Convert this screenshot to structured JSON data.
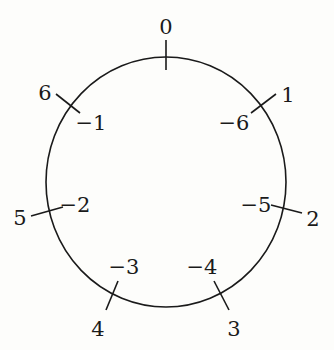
{
  "diagram": {
    "type": "circular number line",
    "circle": {
      "cx": 166,
      "cy": 182,
      "rx": 120,
      "ry": 125,
      "stroke": "#1a1a1a"
    },
    "ticks": [
      {
        "outer": "0",
        "inner": "",
        "x1": 166,
        "y1": 40,
        "x2": 166,
        "y2": 70,
        "ox": 166,
        "oy": 34,
        "ix": 0,
        "iy": 0
      },
      {
        "outer": "1",
        "inner": "-6",
        "x1": 276,
        "y1": 94,
        "x2": 251,
        "y2": 113,
        "ox": 288,
        "oy": 102,
        "ix": 234,
        "iy": 130
      },
      {
        "outer": "2",
        "inner": "-5",
        "x1": 302,
        "y1": 213,
        "x2": 271,
        "y2": 205,
        "ox": 313,
        "oy": 226,
        "ix": 256,
        "iy": 212
      },
      {
        "outer": "3",
        "inner": "-4",
        "x1": 229,
        "y1": 310,
        "x2": 214,
        "y2": 281,
        "ox": 234,
        "oy": 336,
        "ix": 202,
        "iy": 274
      },
      {
        "outer": "4",
        "inner": "-3",
        "x1": 106,
        "y1": 310,
        "x2": 118,
        "y2": 281,
        "ox": 98,
        "oy": 336,
        "ix": 124,
        "iy": 274
      },
      {
        "outer": "5",
        "inner": "-2",
        "x1": 31,
        "y1": 216,
        "x2": 63,
        "y2": 207,
        "ox": 20,
        "oy": 225,
        "ix": 75,
        "iy": 212
      },
      {
        "outer": "6",
        "inner": "-1",
        "x1": 56,
        "y1": 94,
        "x2": 80,
        "y2": 113,
        "ox": 45,
        "oy": 100,
        "ix": 91,
        "iy": 130
      }
    ]
  }
}
